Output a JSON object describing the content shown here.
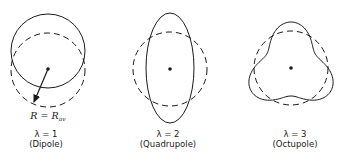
{
  "figure": {
    "stroke_color": "#1a1a1a",
    "panels": [
      {
        "id": "dipole",
        "lambda_label": "λ = 1",
        "name_label": "(Dipole)",
        "radius_label_main": "R = R",
        "radius_label_sub": "av",
        "center": [
          48,
          69
        ],
        "reference_circle": {
          "cx": 48,
          "cy": 70,
          "r": 37,
          "style": "dashed"
        },
        "deformed_shape": {
          "type": "circle",
          "cx": 48,
          "cy": 51,
          "r": 37,
          "style": "solid"
        },
        "arrow": {
          "from": [
            48,
            69
          ],
          "to": [
            33,
            104
          ]
        }
      },
      {
        "id": "quadrupole",
        "lambda_label": "λ = 2",
        "name_label": "(Quadrupole)",
        "center": [
          170,
          69
        ],
        "reference_circle": {
          "cx": 170,
          "cy": 69,
          "r": 37,
          "style": "dashed"
        },
        "deformed_shape": {
          "type": "ellipse",
          "cx": 170,
          "cy": 68,
          "rx": 24,
          "ry": 55,
          "style": "solid"
        }
      },
      {
        "id": "octupole",
        "lambda_label": "λ = 3",
        "name_label": "(Octupole)",
        "center": [
          291,
          68
        ],
        "reference_circle": {
          "cx": 291,
          "cy": 68,
          "r": 37,
          "style": "dashed"
        },
        "deformed_shape": {
          "type": "trefoil",
          "cx": 291,
          "cy": 68,
          "r0": 37,
          "amplitude": 9,
          "lobes": 3,
          "style": "solid"
        }
      }
    ]
  }
}
